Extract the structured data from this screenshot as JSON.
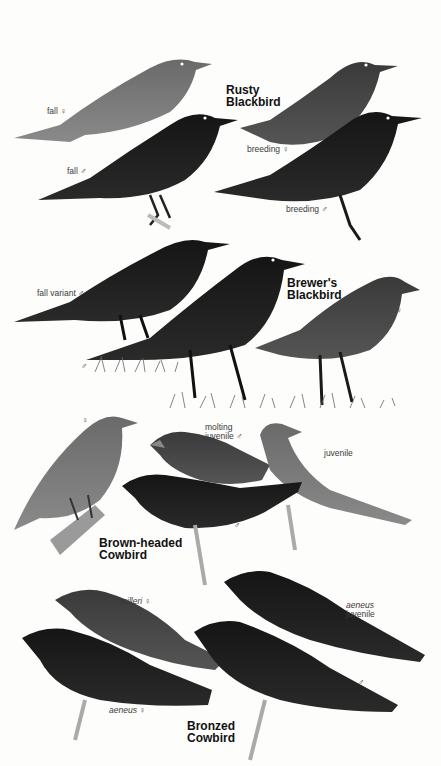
{
  "plate": {
    "species": [
      {
        "name_line1": "Rusty",
        "name_line2": "Blackbird",
        "labels": [
          "fall ♀",
          "fall ♂",
          "breeding ♀",
          "breeding ♂"
        ]
      },
      {
        "name_line1": "Brewer's",
        "name_line2": "Blackbird",
        "labels": [
          "fall variant ♂",
          "♂",
          "♀"
        ]
      },
      {
        "name_line1": "Brown-headed",
        "name_line2": "Cowbird",
        "labels": [
          "♀",
          "molting",
          "juvenile ♂",
          "juvenile",
          "♂"
        ]
      },
      {
        "name_line1": "Bronzed",
        "name_line2": "Cowbird",
        "labels": [
          "milleri ♀",
          "aeneus",
          "juvenile",
          "aeneus ♀",
          "♂"
        ]
      }
    ]
  },
  "colors": {
    "background": "#fdfdfc",
    "bird_dark": "#1a1a1a",
    "bird_mid": "#3b3b3b",
    "bird_light": "#6e6e6e",
    "grass": "#555555"
  }
}
